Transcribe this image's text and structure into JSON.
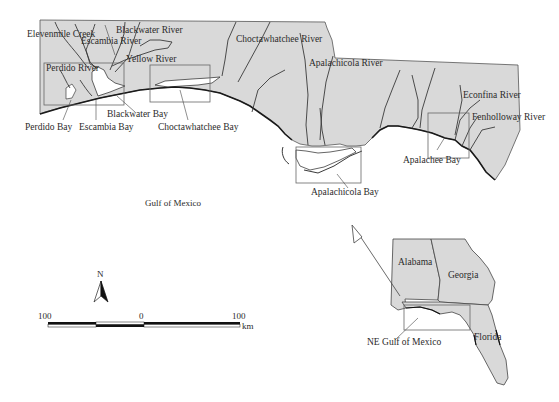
{
  "map": {
    "water_body": "Gulf of Mexico",
    "rivers": [
      {
        "name": "Elevenmile Creek"
      },
      {
        "name": "Escambia River"
      },
      {
        "name": "Blackwater River"
      },
      {
        "name": "Perdido River"
      },
      {
        "name": "Yellow River"
      },
      {
        "name": "Choctawhatchee River"
      },
      {
        "name": "Apalachicola River"
      },
      {
        "name": "Econfina River"
      },
      {
        "name": "Fenholloway River"
      }
    ],
    "bays": [
      {
        "name": "Perdido Bay"
      },
      {
        "name": "Escambia Bay"
      },
      {
        "name": "Blackwater Bay"
      },
      {
        "name": "Choctawhatchee Bay"
      },
      {
        "name": "Apalachicola Bay"
      },
      {
        "name": "Apalachee Bay"
      }
    ],
    "north_arrow": {
      "label": "N"
    },
    "scale_bar": {
      "left": "100",
      "center": "0",
      "right": "100",
      "unit": "km"
    },
    "inset": {
      "states": [
        "Alabama",
        "Georgia",
        "Florida"
      ],
      "region_label": "NE Gulf of Mexico"
    },
    "colors": {
      "land": "#d9d9d9",
      "rivers": "#3a3a3a",
      "water": "#ffffff"
    }
  }
}
